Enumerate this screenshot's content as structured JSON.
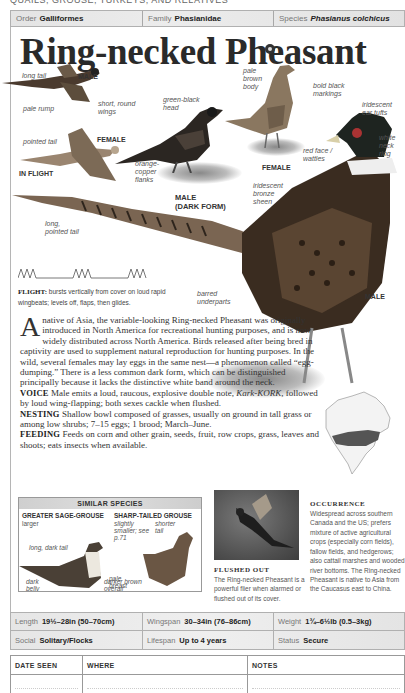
{
  "running_head": "QUAILS, GROUSE, TURKEYS, AND RELATIVES",
  "taxonomy": {
    "order": {
      "label": "Order",
      "value": "Galliformes"
    },
    "family": {
      "label": "Family",
      "value": "Phasianidae"
    },
    "species": {
      "label": "Species",
      "value": "Phasianus colchicus"
    }
  },
  "title": "Ring-necked Pheasant",
  "icons": {
    "audio": "speaker-icon"
  },
  "illustration": {
    "in_flight_caption": "IN FLIGHT",
    "flight_male": {
      "caption": "MALE",
      "labels": [
        "long tail",
        "pale rump",
        "short, round wings"
      ]
    },
    "flight_female": {
      "caption": "FEMALE",
      "labels": [
        "pointed tail"
      ]
    },
    "dark_form": {
      "caption_line1": "MALE",
      "caption_line2": "(DARK FORM)",
      "labels": [
        "green-black head",
        "orange-copper flanks"
      ]
    },
    "female": {
      "caption": "FEMALE",
      "labels": [
        "pale brown body",
        "bold black markings"
      ]
    },
    "male": {
      "caption": "MALE",
      "labels": [
        "iridescent ear tufts",
        "white neck ring",
        "red face / wattles",
        "iridescent bronze sheen",
        "long, pointed tail",
        "barred underparts"
      ]
    }
  },
  "flight": {
    "label": "FLIGHT:",
    "text": "bursts vertically from cover on loud rapid wingbeats; levels off, flaps, then glides."
  },
  "description": {
    "dropcap": "A",
    "intro": " native of Asia, the variable-looking Ring-necked Pheasant was originally introduced in North America for recreational hunting purposes, and is now widely distributed across North America. Birds released after being bred in captivity are used to supplement natural reproduction for hunting purposes. In the wild, several females may lay eggs in the same nest—a phenomenon called “egg-dumping.” There is a less common dark form, which can be distinguished principally because it lacks the distinctive white band around the neck.",
    "voice_label": "VOICE",
    "voice_pre": " Male emits a loud, raucous, explosive double note, ",
    "voice_call": "Kark-KORK",
    "voice_post": ", followed by loud wing-flapping; both sexes cackle when flushed.",
    "nesting_label": "NESTING",
    "nesting": " Shallow bowl composed of grasses, usually on ground in tall grass or among low shrubs; 7–15 eggs; 1 brood; March–June.",
    "feeding_label": "FEEDING",
    "feeding": " Feeds on corn and other grain, seeds, fruit, row crops, grass, leaves and shoots; eats insects when available."
  },
  "similar_species": {
    "title": "SIMILAR SPECIES",
    "species": [
      {
        "name": "GREATER SAGE-GROUSE",
        "note": "larger",
        "labels": [
          "long, dark tail",
          "pale breast",
          "dark belly"
        ]
      },
      {
        "name": "SHARP-TAILED GROUSE",
        "note": "slightly smaller; see p.71",
        "labels": [
          "shorter tail",
          "darker brown overall"
        ]
      }
    ]
  },
  "flushed_out": {
    "title": "FLUSHED OUT",
    "text": "The Ring-necked Pheasant is a powerful flier when alarmed or flushed out of its cover."
  },
  "occurrence": {
    "title": "OCCURRENCE",
    "text": "Widespread across southern Canada and the US; prefers mixture of active agricultural crops (especially corn fields), fallow fields, and hedgerows; also cattail marshes and wooded river bottoms. The Ring-necked Pheasant is native to Asia from the Caucasus east to China."
  },
  "facts": {
    "length": {
      "label": "Length",
      "value": "19½–28in (50–70cm)"
    },
    "wingspan": {
      "label": "Wingspan",
      "value": "30–34in (76–86cm)"
    },
    "weight": {
      "label": "Weight",
      "value": "1¾–6½lb (0.5–3kg)"
    },
    "social": {
      "label": "Social",
      "value": "Solitary/Flocks"
    },
    "lifespan": {
      "label": "Lifespan",
      "value": "Up to 4 years"
    },
    "status": {
      "label": "Status",
      "value": "Secure"
    }
  },
  "notes_table": {
    "headers": [
      "DATE SEEN",
      "WHERE",
      "NOTES"
    ],
    "rows": [
      [
        "",
        "",
        ""
      ]
    ]
  }
}
